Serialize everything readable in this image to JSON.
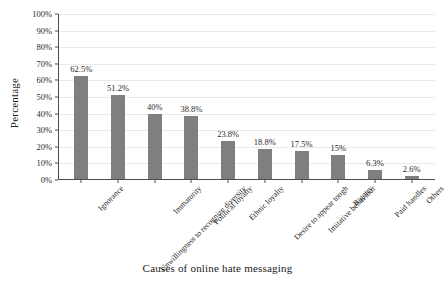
{
  "chart_data": {
    "type": "bar",
    "title": "",
    "xlabel": "Causes of online hate messaging",
    "ylabel": "Percentage",
    "categories": [
      "Ignorance",
      "Unwillingness to recognize diversity",
      "Immaturity",
      "Political loyalty",
      "Ethnic loyalty",
      "Desire to appear tough",
      "Imitative behaviour",
      "Bigotry",
      "Paid handles",
      "Others"
    ],
    "values": [
      62.5,
      51.2,
      40,
      38.8,
      23.8,
      18.8,
      17.5,
      15,
      6.3,
      2.6
    ],
    "value_labels": [
      "62.5%",
      "51.2%",
      "40%",
      "38.8%",
      "23.8%",
      "18.8%",
      "17.5%",
      "15%",
      "6.3%",
      "2.6%"
    ],
    "ylim": [
      0,
      100
    ],
    "ytick_values": [
      0,
      10,
      20,
      30,
      40,
      50,
      60,
      70,
      80,
      90,
      100
    ],
    "ytick_labels": [
      "0%",
      "10%",
      "20%",
      "30%",
      "40%",
      "50%",
      "60%",
      "70%",
      "80%",
      "90%",
      "100%"
    ],
    "grid": true,
    "legend": false,
    "bar_color": "#7f7f7f",
    "axis_color": "#4d4d4d",
    "grid_color": "#e9e9e9",
    "background": "#ffffff"
  }
}
